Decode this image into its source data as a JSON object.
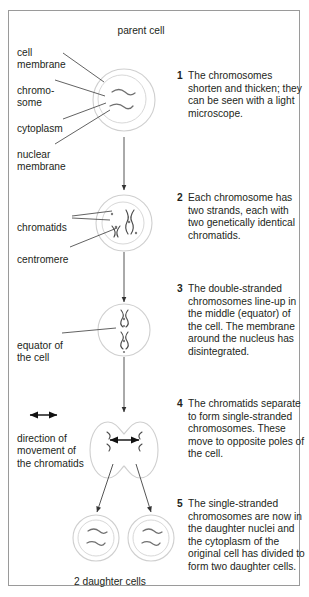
{
  "figure": {
    "title": "parent cell",
    "bottom_caption": "2 daughter cells"
  },
  "labels": {
    "cell_membrane": "cell\nmembrane",
    "chromosome": "chromo-\nsome",
    "cytoplasm": "cytoplasm",
    "nuclear_membrane": "nuclear\nmembrane",
    "chromatids": "chromatids",
    "centromere": "centromere",
    "equator": "equator of\nthe cell",
    "direction": "direction of\nmovement of\nthe chromatids"
  },
  "steps": [
    {
      "number": "1",
      "text": "The chromosomes shorten and thicken; they can be seen with a light microscope."
    },
    {
      "number": "2",
      "text": "Each chromosome has two strands, each with two genetically identical chromatids."
    },
    {
      "number": "3",
      "text": "The double-stranded chromosomes line-up in the middle (equator) of the cell. The membrane around the nucleus has disintegrated."
    },
    {
      "number": "4",
      "text": "The chromatids separate to form single-stranded chromosomes. These move to opposite poles of the cell."
    },
    {
      "number": "5",
      "text": "The single-stranded chromosomes are now in the daughter nuclei and the cytoplasm of the original cell has divided to form two daughter cells."
    }
  ],
  "colors": {
    "frame": "#9a9a9a",
    "membrane": "#cfcfcf",
    "chromosome": "#6f6f6f",
    "text": "#231f20",
    "arrow": "#555555"
  }
}
